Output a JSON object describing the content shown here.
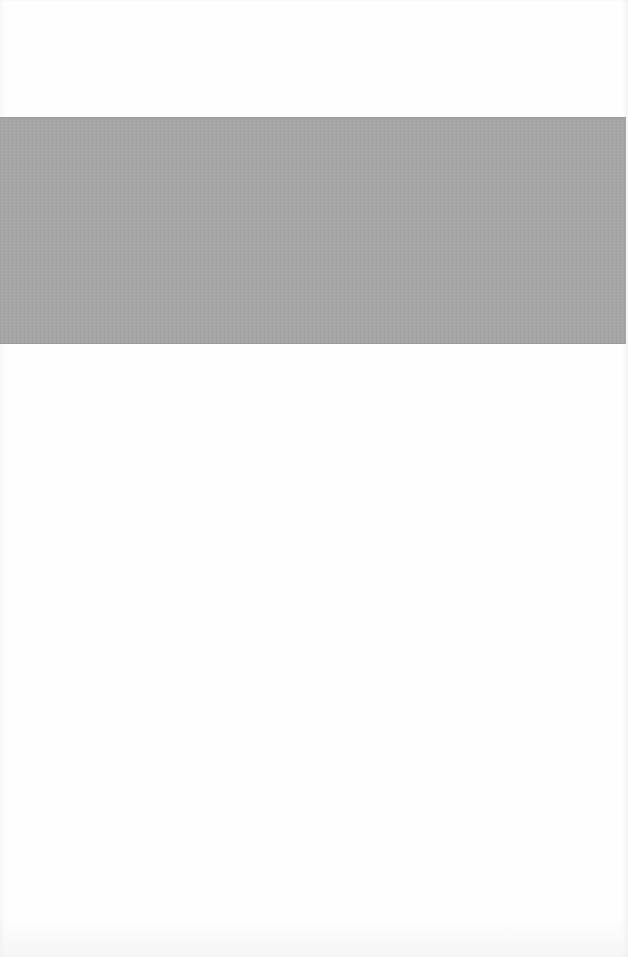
{
  "page": {
    "background_color": "#fefefe",
    "band": {
      "color": "#a6a6a6",
      "text": ""
    },
    "body_text": ""
  }
}
